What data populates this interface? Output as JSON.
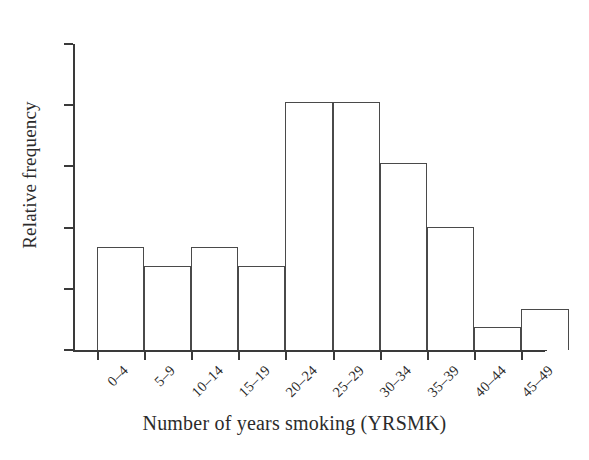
{
  "chart_data": {
    "type": "bar",
    "title": "",
    "subtitle": "",
    "xlabel": "Number of years smoking (YRSMK)",
    "ylabel": "Relative frequency",
    "categories": [
      "0–4",
      "5–9",
      "10–14",
      "15–19",
      "20–24",
      "25–29",
      "30–34",
      "35–39",
      "40–44",
      "45–49"
    ],
    "values": [
      0.337,
      0.275,
      0.337,
      0.275,
      0.81,
      0.81,
      0.611,
      0.402,
      0.075,
      0.134
    ],
    "ylim": [
      0,
      1.0
    ],
    "xlim": [
      0,
      10
    ],
    "grid": false,
    "legend": false,
    "legend_position": "none",
    "y_axis_tick_labels": [],
    "y_tick_positions": [
      0.0,
      0.2,
      0.4,
      0.6,
      0.8,
      1.0
    ],
    "bar_style": "open-outline",
    "bar_fill": "#ffffff",
    "bar_edge_color": "#4a4a4a",
    "axis_color": "#3a3a3a",
    "background": "#ffffff"
  },
  "figure": {
    "background_color": "#ffffff",
    "text_color": "#2b2b2b"
  }
}
